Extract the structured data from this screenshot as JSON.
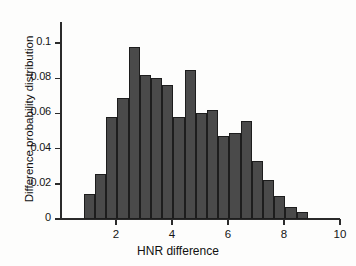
{
  "chart_data": {
    "type": "bar",
    "title": "",
    "xlabel": "HNR difference",
    "ylabel": "Difference probability distribution",
    "xlim": [
      0,
      10
    ],
    "ylim": [
      0,
      0.112
    ],
    "grid": false,
    "legend": null,
    "xticks": [
      2,
      4,
      6,
      8,
      10
    ],
    "xtick_labels": [
      "2",
      "4",
      "6",
      "8",
      "10"
    ],
    "yticks": [
      0,
      0.02,
      0.04,
      0.06,
      0.08,
      0.1
    ],
    "ytick_labels": [
      "0",
      "0.02",
      "0.04",
      "0.06",
      "0.08",
      "0.1"
    ],
    "bin_width": 0.4,
    "bin_start": 0.85,
    "bar_color": "#4a4a4a",
    "bar_edge_color": "#1d1d1d",
    "categories": [
      1.05,
      1.45,
      1.85,
      2.25,
      2.65,
      3.05,
      3.45,
      3.85,
      4.25,
      4.65,
      5.05,
      5.45,
      5.85,
      6.25,
      6.65,
      7.05,
      7.45,
      7.85,
      8.25,
      8.65,
      9.05
    ],
    "values": [
      0.0145,
      0.0255,
      0.058,
      0.069,
      0.098,
      0.082,
      0.08,
      0.076,
      0.058,
      0.085,
      0.06,
      0.062,
      0.047,
      0.049,
      0.056,
      0.033,
      0.022,
      0.013,
      0.007,
      0.004,
      0.0
    ]
  },
  "axes": {
    "x_axis_label": "HNR difference",
    "y_axis_label": "Difference probability distribution"
  }
}
